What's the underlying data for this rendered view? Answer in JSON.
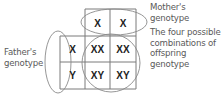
{
  "diagram": {
    "type": "punnett-square",
    "mother_label": [
      "Mother's",
      "genotype"
    ],
    "father_label": [
      "Father's",
      "genotype"
    ],
    "offspring_label": [
      "The four possible",
      "combinations of",
      "offspring",
      "genotype"
    ],
    "mother_alleles": [
      "X",
      "X"
    ],
    "father_alleles": [
      "X",
      "Y"
    ],
    "offspring": [
      [
        "XX",
        "XX"
      ],
      [
        "XY",
        "XY"
      ]
    ],
    "colors": {
      "grid": "#777777",
      "text": "#222222",
      "label": "#5a5a5a"
    }
  }
}
